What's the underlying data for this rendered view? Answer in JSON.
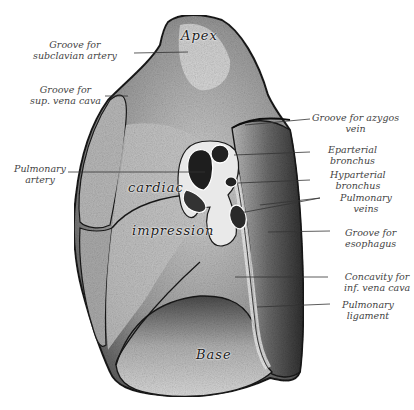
{
  "figure": {
    "region_labels": {
      "apex": "Apex",
      "cardiac": "cardiac",
      "impression": "impression",
      "base": "Base"
    },
    "left_labels": [
      {
        "line1": "Groove for",
        "line2": "subclavian artery"
      },
      {
        "line1": "Groove for",
        "line2": "sup. vena cava"
      },
      {
        "line1": "Pulmonary",
        "line2": "artery"
      }
    ],
    "right_labels": [
      {
        "line1": "Groove for azygos",
        "line2": "vein"
      },
      {
        "line1": "Eparterial",
        "line2": "bronchus"
      },
      {
        "line1": "Hyparterial",
        "line2": "bronchus"
      },
      {
        "line1": "Pulmonary",
        "line2": "veins"
      },
      {
        "line1": "Groove for",
        "line2": "esophagus"
      },
      {
        "line1": "Concavity for",
        "line2": "inf. vena cava"
      },
      {
        "line1": "Pulmonary",
        "line2": "ligament"
      }
    ]
  },
  "colors": {
    "ink": "#1a1a1a",
    "lung_light": "#c8c8c8",
    "lung_mid": "#8a8a8a",
    "lung_dark": "#3a3a3a",
    "label": "#444444"
  }
}
